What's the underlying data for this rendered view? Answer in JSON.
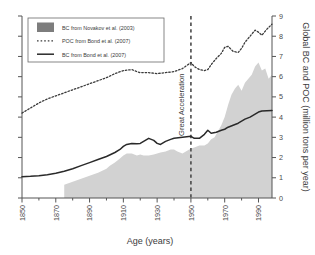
{
  "chart_data": {
    "type": "area",
    "title": "",
    "xlabel": "Age (years)",
    "ylabel": "Global BC and POC (million tons per year)",
    "xlim": [
      1850,
      1998
    ],
    "ylim": [
      0,
      9
    ],
    "xticks": [
      1850,
      1870,
      1890,
      1910,
      1930,
      1950,
      1970,
      1990
    ],
    "yticks": [
      0,
      1,
      2,
      3,
      4,
      5,
      6,
      7,
      8,
      9
    ],
    "grid": false,
    "legend_position": "top-left",
    "y_axis_side": "right",
    "annotations": [
      {
        "text": "Great Acceleration",
        "x": 1950,
        "orientation": "vertical",
        "marker": "dashed-vertical-line"
      }
    ],
    "series": [
      {
        "name": "BC from Novakov et al. (2003)",
        "style": "filled-area",
        "color": "#d2d2d2",
        "legend_swatch_color": "#7d7d7d",
        "x": [
          1875,
          1880,
          1885,
          1890,
          1895,
          1900,
          1902,
          1905,
          1908,
          1910,
          1912,
          1915,
          1918,
          1920,
          1922,
          1925,
          1928,
          1930,
          1932,
          1935,
          1938,
          1940,
          1942,
          1945,
          1948,
          1950,
          1952,
          1955,
          1958,
          1960,
          1962,
          1964,
          1966,
          1968,
          1970,
          1972,
          1974,
          1976,
          1978,
          1980,
          1982,
          1984,
          1986,
          1988,
          1990,
          1992,
          1994,
          1996,
          1998
        ],
        "values": [
          0.65,
          0.8,
          0.95,
          1.1,
          1.25,
          1.45,
          1.6,
          1.75,
          1.95,
          2.1,
          2.2,
          2.2,
          2.1,
          2.15,
          2.1,
          2.1,
          2.15,
          2.2,
          2.25,
          2.3,
          2.4,
          2.4,
          2.3,
          2.2,
          2.35,
          2.45,
          2.5,
          2.6,
          2.6,
          2.7,
          2.9,
          3.0,
          3.3,
          3.6,
          4.0,
          4.6,
          5.1,
          5.4,
          5.6,
          5.3,
          5.7,
          5.9,
          6.1,
          6.5,
          6.7,
          6.3,
          6.4,
          5.9,
          6.1
        ]
      },
      {
        "name": "POC from Bond et al. (2007)",
        "style": "dotted-line",
        "color": "#3b3b3b",
        "x": [
          1850,
          1855,
          1860,
          1865,
          1870,
          1875,
          1880,
          1885,
          1890,
          1895,
          1900,
          1905,
          1910,
          1915,
          1918,
          1920,
          1925,
          1930,
          1935,
          1940,
          1945,
          1950,
          1952,
          1955,
          1958,
          1960,
          1962,
          1965,
          1968,
          1970,
          1972,
          1975,
          1978,
          1980,
          1982,
          1985,
          1988,
          1990,
          1992,
          1995,
          1998
        ],
        "values": [
          4.2,
          4.45,
          4.7,
          4.9,
          5.05,
          5.2,
          5.35,
          5.5,
          5.65,
          5.8,
          5.95,
          6.15,
          6.3,
          6.35,
          6.25,
          6.2,
          6.2,
          6.15,
          6.2,
          6.25,
          6.4,
          6.7,
          6.5,
          6.35,
          6.3,
          6.35,
          6.6,
          6.9,
          7.15,
          7.45,
          7.5,
          7.25,
          7.2,
          7.4,
          7.7,
          8.0,
          8.3,
          8.2,
          8.05,
          8.35,
          8.6
        ]
      },
      {
        "name": "BC from Bond et al. (2007)",
        "style": "solid-line",
        "color": "#2a2a2a",
        "x": [
          1850,
          1855,
          1860,
          1865,
          1870,
          1875,
          1880,
          1885,
          1890,
          1895,
          1900,
          1905,
          1908,
          1910,
          1912,
          1915,
          1918,
          1920,
          1922,
          1925,
          1928,
          1930,
          1932,
          1935,
          1938,
          1940,
          1945,
          1950,
          1952,
          1955,
          1958,
          1960,
          1962,
          1965,
          1968,
          1970,
          1972,
          1975,
          1978,
          1980,
          1982,
          1985,
          1988,
          1990,
          1992,
          1995,
          1998
        ],
        "values": [
          1.05,
          1.07,
          1.1,
          1.15,
          1.22,
          1.32,
          1.45,
          1.6,
          1.75,
          1.9,
          2.05,
          2.25,
          2.4,
          2.55,
          2.65,
          2.7,
          2.68,
          2.7,
          2.8,
          2.95,
          2.85,
          2.7,
          2.65,
          2.8,
          2.9,
          2.95,
          3.0,
          3.05,
          2.95,
          2.95,
          3.15,
          3.35,
          3.2,
          3.25,
          3.35,
          3.4,
          3.5,
          3.6,
          3.7,
          3.8,
          3.9,
          4.0,
          4.15,
          4.25,
          4.3,
          4.32,
          4.33
        ]
      }
    ]
  },
  "legend": {
    "items": [
      {
        "label": "BC from Novakov et al. (2003)",
        "marker": "swatch"
      },
      {
        "label": "POC from Bond et al. (2007)",
        "marker": "dotted"
      },
      {
        "label": "BC from Bond et al. (2007)",
        "marker": "solid"
      }
    ]
  },
  "axes": {
    "x_title": "Age (years)",
    "y_title": "Global BC and POC (million tons per year)",
    "x_tick_labels": [
      "1850",
      "1870",
      "1890",
      "1910",
      "1930",
      "1950",
      "1970",
      "1990"
    ],
    "y_tick_labels": [
      "0",
      "1",
      "2",
      "3",
      "4",
      "5",
      "6",
      "7",
      "8",
      "9"
    ]
  },
  "annotation": {
    "great_acceleration": "Great Acceleration"
  },
  "colors": {
    "area_fill": "#d2d2d2",
    "legend_swatch": "#7d7d7d",
    "line_dark": "#2a2a2a",
    "axis": "#555555",
    "background": "#ffffff"
  }
}
